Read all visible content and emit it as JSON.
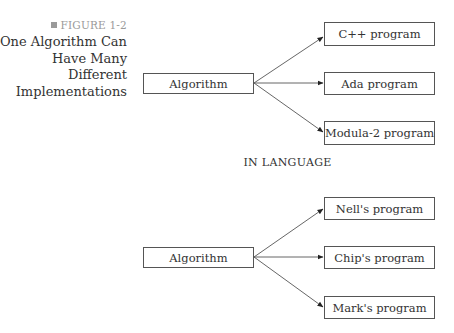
{
  "caption": {
    "figure_label": "FIGURE 1-2",
    "title_lines": [
      "One Algorithm Can",
      "Have Many",
      "Different",
      "Implementations"
    ]
  },
  "diagram_top": {
    "source": "Algorithm",
    "targets": [
      "C++ program",
      "Ada program",
      "Modula-2 program"
    ]
  },
  "section_label": "IN LANGUAGE",
  "diagram_bottom": {
    "source": "Algorithm",
    "targets": [
      "Nell's program",
      "Chip's program",
      "Mark's program"
    ]
  }
}
